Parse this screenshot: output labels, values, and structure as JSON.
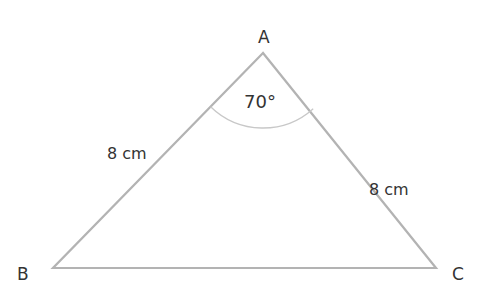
{
  "diagram": {
    "type": "isosceles triangle",
    "vertices": {
      "A": {
        "label": "A"
      },
      "B": {
        "label": "B"
      },
      "C": {
        "label": "C"
      }
    },
    "sides": {
      "AB": {
        "label": "8 cm"
      },
      "AC": {
        "label": "8 cm"
      }
    },
    "angle_A": {
      "label": "70°"
    },
    "colors": {
      "line": "#b3b3b3",
      "arc": "#c8c8c8",
      "text": "#333333"
    }
  }
}
